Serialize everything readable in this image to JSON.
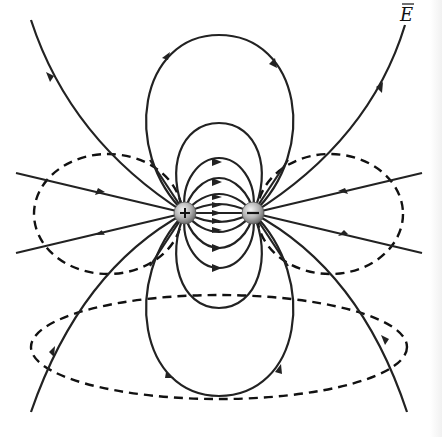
{
  "figure": {
    "field_label": "E",
    "field_label_has_overbar": true,
    "charges": [
      {
        "sign": "+",
        "symbol": "+",
        "x": 185,
        "y": 213
      },
      {
        "sign": "-",
        "symbol": "−",
        "x": 253,
        "y": 213
      }
    ],
    "legend": {
      "solid_lines": "electric field lines",
      "dashed_lines": "equipotential surfaces"
    },
    "colors": {
      "line": "#222222",
      "background": "#ffffff",
      "charge_fill": "#b8b8b8"
    }
  }
}
